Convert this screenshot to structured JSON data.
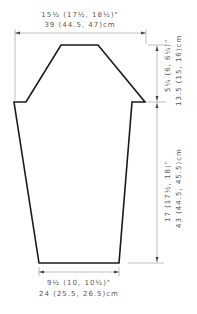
{
  "diagram": {
    "type": "garment-schematic",
    "colors": {
      "outline": "#1a1a1a",
      "dimension_line": "#b0b0b0",
      "text": "#555555",
      "background": "#ffffff"
    },
    "dimensions": {
      "top_width": {
        "inches": "15½ (17½, 18½)\"",
        "cm": "39 (44.5, 47)cm"
      },
      "shoulder_depth": {
        "inches": "5¼ (6, 6¼)\"",
        "cm": "13.5 (15, 16)cm"
      },
      "body_length": {
        "inches": "17 (17½, 18)\"",
        "cm": "43 (44.5, 45.5)cm"
      },
      "bottom_width": {
        "inches": "9½ (10, 10½)\"",
        "cm": "24 (25.5, 26.5)cm"
      }
    },
    "shape_points": [
      [
        61,
        45
      ],
      [
        98,
        45
      ],
      [
        145,
        102
      ],
      [
        132,
        102
      ],
      [
        119,
        263
      ],
      [
        39,
        263
      ],
      [
        14,
        102
      ],
      [
        26,
        102
      ]
    ]
  }
}
